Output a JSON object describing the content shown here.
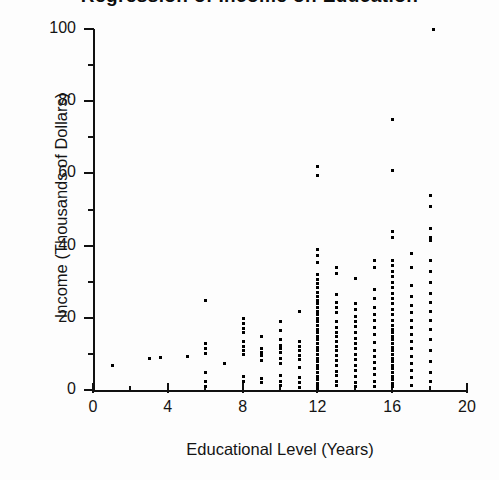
{
  "figure": {
    "background_color": "#fdfdfd",
    "ink_color": "#000000",
    "title_clipped": "Regression of Income on Education",
    "ylabel": "Income (Thousands of Dollars)",
    "xlabel": "Educational Level (Years)"
  },
  "axes": {
    "x_ticks": [
      "0",
      "4",
      "8",
      "12",
      "16",
      "20"
    ],
    "y_ticks": [
      "0",
      "20",
      "40",
      "60",
      "80",
      "100"
    ]
  },
  "chart_data": {
    "type": "scatter",
    "title": "Regression of Income on Education",
    "xlabel": "Educational Level (Years)",
    "ylabel": "Income (Thousands of Dollars)",
    "xlim": [
      0,
      20
    ],
    "ylim": [
      0,
      100
    ],
    "xticks": [
      0,
      4,
      8,
      12,
      16,
      20
    ],
    "yticks": [
      0,
      20,
      40,
      60,
      80,
      100
    ],
    "x_minor_tick_step": 2,
    "y_minor_tick_step": 10,
    "grid": false,
    "legend": false,
    "marker": "small-black-square",
    "marker_size_px": 3,
    "series": [
      {
        "name": "Respondents",
        "points": [
          [
            1,
            7
          ],
          [
            3,
            9
          ],
          [
            3.6,
            9.2
          ],
          [
            5,
            9.3
          ],
          [
            6,
            25
          ],
          [
            6,
            13
          ],
          [
            6,
            11.5
          ],
          [
            6,
            10.2
          ],
          [
            6,
            5
          ],
          [
            6,
            2.5
          ],
          [
            6,
            1.2
          ],
          [
            7,
            7.5
          ],
          [
            8,
            20
          ],
          [
            8,
            18.5
          ],
          [
            8,
            17.2
          ],
          [
            8,
            16
          ],
          [
            8,
            13.5
          ],
          [
            8,
            12.3
          ],
          [
            8,
            11.2
          ],
          [
            8,
            10
          ],
          [
            8,
            4
          ],
          [
            8,
            2.6
          ],
          [
            9,
            15
          ],
          [
            9,
            11.5
          ],
          [
            9,
            10.6
          ],
          [
            9,
            9.8
          ],
          [
            9,
            8.4
          ],
          [
            9,
            3.4
          ],
          [
            9,
            2.2
          ],
          [
            10,
            19
          ],
          [
            10,
            16.5
          ],
          [
            10,
            14
          ],
          [
            10,
            12.6
          ],
          [
            10,
            11.5
          ],
          [
            10,
            10.4
          ],
          [
            10,
            9
          ],
          [
            10,
            7.4
          ],
          [
            10,
            4.2
          ],
          [
            10,
            2.4
          ],
          [
            10,
            1.3
          ],
          [
            11,
            22
          ],
          [
            11,
            13.5
          ],
          [
            11,
            12.2
          ],
          [
            11,
            11
          ],
          [
            11,
            9.6
          ],
          [
            11,
            8.5
          ],
          [
            11,
            6.4
          ],
          [
            11,
            3.6
          ],
          [
            11,
            2.1
          ],
          [
            11,
            0.8
          ],
          [
            12,
            62
          ],
          [
            12,
            59.5
          ],
          [
            12,
            39
          ],
          [
            12,
            37.5
          ],
          [
            12,
            35.5
          ],
          [
            12,
            32
          ],
          [
            12,
            30.8
          ],
          [
            12,
            29.6
          ],
          [
            12,
            28.4
          ],
          [
            12,
            27.2
          ],
          [
            12,
            26
          ],
          [
            12,
            25
          ],
          [
            12,
            24
          ],
          [
            12,
            23
          ],
          [
            12,
            22
          ],
          [
            12,
            21
          ],
          [
            12,
            20
          ],
          [
            12,
            19
          ],
          [
            12,
            18
          ],
          [
            12,
            17
          ],
          [
            12,
            16
          ],
          [
            12,
            15
          ],
          [
            12,
            14
          ],
          [
            12,
            13
          ],
          [
            12,
            12
          ],
          [
            12,
            11
          ],
          [
            12,
            10
          ],
          [
            12,
            9
          ],
          [
            12,
            8
          ],
          [
            12,
            7
          ],
          [
            12,
            6
          ],
          [
            12,
            5
          ],
          [
            12,
            4
          ],
          [
            12,
            3
          ],
          [
            12,
            2
          ],
          [
            12,
            1
          ],
          [
            12,
            0.5
          ],
          [
            13,
            34
          ],
          [
            13,
            32.5
          ],
          [
            13,
            26.5
          ],
          [
            13,
            24.5
          ],
          [
            13,
            23
          ],
          [
            13,
            21.5
          ],
          [
            13,
            19
          ],
          [
            13,
            17.5
          ],
          [
            13,
            16.2
          ],
          [
            13,
            15
          ],
          [
            13,
            13.5
          ],
          [
            13,
            12.2
          ],
          [
            13,
            11
          ],
          [
            13,
            9.6
          ],
          [
            13,
            8.2
          ],
          [
            13,
            7
          ],
          [
            13,
            5.4
          ],
          [
            13,
            4.2
          ],
          [
            13,
            2.6
          ],
          [
            13,
            1.4
          ],
          [
            14,
            31
          ],
          [
            14,
            24
          ],
          [
            14,
            22.5
          ],
          [
            14,
            20.5
          ],
          [
            14,
            19
          ],
          [
            14,
            17.6
          ],
          [
            14,
            16
          ],
          [
            14,
            14.5
          ],
          [
            14,
            13
          ],
          [
            14,
            11.5
          ],
          [
            14,
            10
          ],
          [
            14,
            8.6
          ],
          [
            14,
            7
          ],
          [
            14,
            5.5
          ],
          [
            14,
            3.8
          ],
          [
            14,
            2.2
          ],
          [
            14,
            1
          ],
          [
            15,
            36
          ],
          [
            15,
            34
          ],
          [
            15,
            28
          ],
          [
            15,
            25.5
          ],
          [
            15,
            23
          ],
          [
            15,
            21
          ],
          [
            15,
            19.4
          ],
          [
            15,
            17.5
          ],
          [
            15,
            15.5
          ],
          [
            15,
            13.2
          ],
          [
            15,
            11
          ],
          [
            15,
            9.5
          ],
          [
            15,
            7.8
          ],
          [
            15,
            6
          ],
          [
            15,
            4.4
          ],
          [
            15,
            2.4
          ],
          [
            15,
            1.2
          ],
          [
            16,
            75
          ],
          [
            16,
            61
          ],
          [
            16,
            44
          ],
          [
            16,
            42.5
          ],
          [
            16,
            36
          ],
          [
            16,
            34.5
          ],
          [
            16,
            33
          ],
          [
            16,
            31.5
          ],
          [
            16,
            30
          ],
          [
            16,
            28.5
          ],
          [
            16,
            27
          ],
          [
            16,
            25.5
          ],
          [
            16,
            24
          ],
          [
            16,
            22.5
          ],
          [
            16,
            21
          ],
          [
            16,
            19.5
          ],
          [
            16,
            18
          ],
          [
            16,
            17
          ],
          [
            16,
            16
          ],
          [
            16,
            15
          ],
          [
            16,
            14
          ],
          [
            16,
            13
          ],
          [
            16,
            12
          ],
          [
            16,
            11
          ],
          [
            16,
            10
          ],
          [
            16,
            9
          ],
          [
            16,
            8
          ],
          [
            16,
            7
          ],
          [
            16,
            6
          ],
          [
            16,
            5
          ],
          [
            16,
            4
          ],
          [
            16,
            3
          ],
          [
            16,
            2
          ],
          [
            16,
            1
          ],
          [
            17,
            38
          ],
          [
            17,
            34
          ],
          [
            17,
            29
          ],
          [
            17,
            26
          ],
          [
            17,
            23.5
          ],
          [
            17,
            21.5
          ],
          [
            17,
            19.5
          ],
          [
            17,
            17.5
          ],
          [
            17,
            15.5
          ],
          [
            17,
            13.5
          ],
          [
            17,
            11.5
          ],
          [
            17,
            9.5
          ],
          [
            17,
            7.5
          ],
          [
            17,
            5.5
          ],
          [
            17,
            3.5
          ],
          [
            17,
            1.5
          ],
          [
            18,
            54
          ],
          [
            18,
            51
          ],
          [
            18,
            45
          ],
          [
            18,
            42.5
          ],
          [
            18,
            41.5
          ],
          [
            18,
            36
          ],
          [
            18,
            33
          ],
          [
            18,
            30
          ],
          [
            18,
            27
          ],
          [
            18,
            24.5
          ],
          [
            18,
            22
          ],
          [
            18,
            19.5
          ],
          [
            18,
            17
          ],
          [
            18,
            14
          ],
          [
            18,
            11
          ],
          [
            18,
            8
          ],
          [
            18,
            5
          ],
          [
            18,
            2.5
          ],
          [
            18.2,
            100
          ]
        ]
      }
    ]
  }
}
